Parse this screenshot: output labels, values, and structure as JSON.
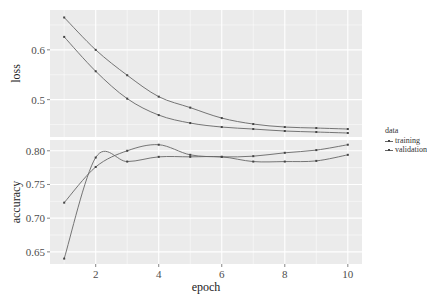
{
  "chart_data": {
    "type": "line",
    "title": "",
    "xlabel": "epoch",
    "x": [
      1,
      2,
      3,
      4,
      5,
      6,
      7,
      8,
      9,
      10
    ],
    "x_ticks": [
      2,
      4,
      6,
      8,
      10
    ],
    "grid": true,
    "legend": {
      "title": "data",
      "position": "right",
      "entries": [
        "training",
        "validation"
      ]
    },
    "panels": [
      {
        "name": "loss",
        "ylabel": "loss",
        "y_ticks": [
          "0.5",
          "0.6"
        ],
        "ylim": [
          0.425,
          0.68
        ],
        "series": [
          {
            "name": "training",
            "values": [
              0.626,
              0.557,
              0.502,
              0.469,
              0.453,
              0.445,
              0.441,
              0.437,
              0.435,
              0.433
            ]
          },
          {
            "name": "validation",
            "values": [
              0.665,
              0.6,
              0.549,
              0.506,
              0.484,
              0.463,
              0.451,
              0.445,
              0.443,
              0.441
            ]
          }
        ]
      },
      {
        "name": "accuracy",
        "ylabel": "accuracy",
        "y_ticks": [
          "0.65",
          "0.70",
          "0.75",
          "0.80"
        ],
        "ylim": [
          0.632,
          0.816
        ],
        "series": [
          {
            "name": "training",
            "values": [
              0.723,
              0.776,
              0.8,
              0.809,
              0.794,
              0.791,
              0.792,
              0.797,
              0.801,
              0.809
            ]
          },
          {
            "name": "validation",
            "values": [
              0.64,
              0.79,
              0.784,
              0.791,
              0.791,
              0.791,
              0.784,
              0.784,
              0.785,
              0.794
            ]
          }
        ]
      }
    ]
  }
}
